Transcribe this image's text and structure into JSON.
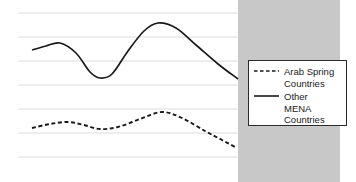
{
  "chart_data": {
    "type": "line",
    "title": "",
    "subtitle": "",
    "xlabel": "",
    "ylabel": "",
    "grid": true,
    "gridlines_y": [
      13,
      37,
      61,
      85,
      109,
      133,
      157
    ],
    "axis_ranges": {
      "x_pixels": [
        18,
        340
      ],
      "y_pixels": [
        13,
        157
      ]
    },
    "legend_position": "right-middle",
    "shaded_region": {
      "label": "projection",
      "x_start_pixels": 238,
      "x_end_pixels": 340,
      "color": "#c8c8c8"
    },
    "series": [
      {
        "name": "Arab Spring Countries",
        "style": "dashed",
        "color": "#1a1a1a",
        "points": [
          {
            "x": 32,
            "y": 128
          },
          {
            "x": 50,
            "y": 124
          },
          {
            "x": 68,
            "y": 122
          },
          {
            "x": 84,
            "y": 125
          },
          {
            "x": 100,
            "y": 129
          },
          {
            "x": 118,
            "y": 127
          },
          {
            "x": 140,
            "y": 119
          },
          {
            "x": 162,
            "y": 112
          },
          {
            "x": 182,
            "y": 118
          },
          {
            "x": 205,
            "y": 131
          },
          {
            "x": 222,
            "y": 140
          },
          {
            "x": 235,
            "y": 147
          }
        ]
      },
      {
        "name": "Other MENA Countries",
        "style": "solid",
        "color": "#1a1a1a",
        "points": [
          {
            "x": 32,
            "y": 50
          },
          {
            "x": 46,
            "y": 46
          },
          {
            "x": 60,
            "y": 43
          },
          {
            "x": 76,
            "y": 53
          },
          {
            "x": 90,
            "y": 72
          },
          {
            "x": 100,
            "y": 78
          },
          {
            "x": 112,
            "y": 74
          },
          {
            "x": 128,
            "y": 51
          },
          {
            "x": 144,
            "y": 31
          },
          {
            "x": 158,
            "y": 23
          },
          {
            "x": 176,
            "y": 28
          },
          {
            "x": 196,
            "y": 45
          },
          {
            "x": 218,
            "y": 64
          },
          {
            "x": 238,
            "y": 79
          }
        ]
      }
    ],
    "legend": {
      "entries": [
        {
          "label": "Arab Spring\nCountries",
          "style": "dashed"
        },
        {
          "label": "Other\nMENA\nCountries",
          "style": "solid"
        }
      ]
    },
    "colors": {
      "background": "#ffffff",
      "gridline": "#dcdcdc",
      "line": "#1a1a1a",
      "shaded_band": "#c8c8c8",
      "legend_border": "#2b2b2b"
    }
  }
}
